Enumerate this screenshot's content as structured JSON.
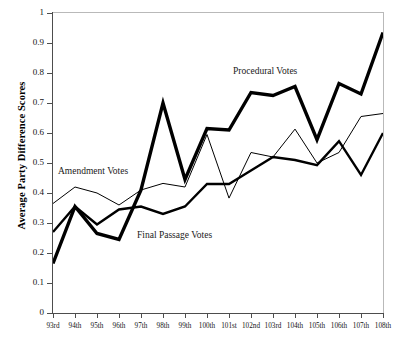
{
  "chart_data": {
    "type": "line",
    "title": "",
    "xlabel": "",
    "ylabel": "Average Party Difference Scores",
    "ylim": [
      0,
      1
    ],
    "ytick_labels": [
      "1",
      "0.9",
      "0.8",
      "0.7",
      "0.6",
      "0.5",
      "0.4",
      "0.3",
      "0.2",
      "0.1",
      "0"
    ],
    "ytick_values": [
      1,
      0.9,
      0.8,
      0.7,
      0.6,
      0.5,
      0.4,
      0.3,
      0.2,
      0.1,
      0
    ],
    "grid": false,
    "legend_position": "inline-annotations",
    "categories": [
      "93rd",
      "94th",
      "95th",
      "96th",
      "97th",
      "98th",
      "99th",
      "100th",
      "101st",
      "102nd",
      "103rd",
      "104th",
      "105th",
      "106th",
      "107th",
      "108th"
    ],
    "series": [
      {
        "name": "Procedural Votes",
        "style": "thick-black",
        "color": "#000000",
        "width": 3.4,
        "values": [
          0.165,
          0.355,
          0.265,
          0.245,
          0.41,
          0.7,
          0.445,
          0.615,
          0.61,
          0.735,
          0.725,
          0.755,
          0.578,
          0.765,
          0.73,
          0.935
        ]
      },
      {
        "name": "Amendment Votes",
        "style": "thin-black",
        "color": "#000000",
        "width": 1.0,
        "values": [
          0.365,
          0.42,
          0.4,
          0.36,
          0.41,
          0.432,
          0.42,
          0.595,
          0.383,
          0.535,
          0.52,
          0.613,
          0.5,
          0.535,
          0.655,
          0.665
        ]
      },
      {
        "name": "Final Passage Votes",
        "style": "medium-black",
        "color": "#000000",
        "width": 2.4,
        "values": [
          0.27,
          0.355,
          0.295,
          0.345,
          0.355,
          0.33,
          0.355,
          0.43,
          0.43,
          0.475,
          0.52,
          0.51,
          0.493,
          0.573,
          0.46,
          0.6
        ]
      }
    ],
    "annotations": [
      {
        "text": "Procedural Votes",
        "series": "Procedural Votes"
      },
      {
        "text": "Amendment Votes",
        "series": "Amendment Votes"
      },
      {
        "text": "Final Passage Votes",
        "series": "Final Passage Votes"
      }
    ]
  },
  "axes": {
    "y_title": "Average Party Difference Scores"
  },
  "colors": {
    "axis": "#4d4d4d",
    "line": "#000000",
    "background": "#ffffff"
  }
}
